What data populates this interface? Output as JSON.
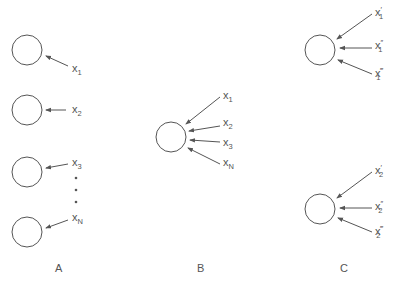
{
  "panels": {
    "A": {
      "caption": "A",
      "inputs": [
        {
          "base": "x",
          "sub": "1"
        },
        {
          "base": "x",
          "sub": "2"
        },
        {
          "base": "x",
          "sub": "3"
        },
        {
          "base": "x",
          "sub": "N"
        }
      ],
      "ellipsis": "• • •"
    },
    "B": {
      "caption": "B",
      "inputs": [
        {
          "base": "x",
          "sub": "1"
        },
        {
          "base": "x",
          "sub": "2"
        },
        {
          "base": "x",
          "sub": "3"
        },
        {
          "base": "x",
          "sub": "N"
        }
      ]
    },
    "C": {
      "caption": "C",
      "groups": [
        {
          "inputs": [
            {
              "base": "x",
              "prime": "′",
              "sub": "1"
            },
            {
              "base": "x",
              "prime": "″",
              "sub": "1"
            },
            {
              "base": "x",
              "prime": "‴",
              "sub": "1"
            }
          ]
        },
        {
          "inputs": [
            {
              "base": "x",
              "prime": "′",
              "sub": "2"
            },
            {
              "base": "x",
              "prime": "″",
              "sub": "2"
            },
            {
              "base": "x",
              "prime": "‴",
              "sub": "2"
            }
          ]
        }
      ]
    }
  },
  "colors": {
    "stroke": "#555555",
    "text": "#555555"
  }
}
